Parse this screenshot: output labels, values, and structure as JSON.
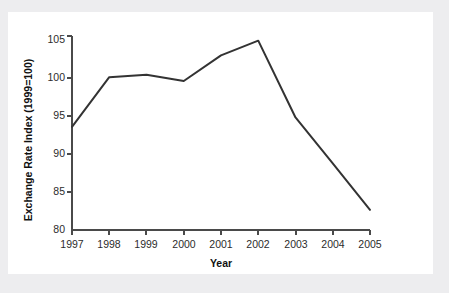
{
  "chart_data": {
    "type": "line",
    "title": "",
    "subtitle": "",
    "xlabel": "Year",
    "ylabel": "Exchange Rate Index (1999=100)",
    "categories": [
      "1997",
      "1998",
      "1999",
      "2000",
      "2001",
      "2002",
      "2003",
      "2004",
      "2005"
    ],
    "x": [
      1997,
      1998,
      1999,
      2000,
      2001,
      2002,
      2003,
      2004,
      2005
    ],
    "values": [
      93.3,
      99.7,
      100.0,
      99.2,
      102.5,
      104.4,
      94.5,
      88.6,
      82.6
    ],
    "series": [
      {
        "name": "Exchange Rate Index",
        "values": [
          93.3,
          99.7,
          100.0,
          99.2,
          102.5,
          104.4,
          94.5,
          88.6,
          82.6
        ],
        "color": "#333333"
      }
    ],
    "ylim": [
      80,
      105
    ],
    "xlim": [
      1997,
      2005
    ],
    "yticks": [
      80,
      85,
      90,
      95,
      100,
      105
    ],
    "ytick_labels": [
      "80",
      "85",
      "90",
      "95",
      "100",
      "105"
    ],
    "xticks": [
      1997,
      1998,
      1999,
      2000,
      2001,
      2002,
      2003,
      2004,
      2005
    ],
    "xtick_labels": [
      "1997",
      "1998",
      "1999",
      "2000",
      "2001",
      "2002",
      "2003",
      "2004",
      "2005"
    ],
    "grid": false,
    "legend": false,
    "legend_position": "none",
    "markers": false,
    "annotations": []
  },
  "style": {
    "page_background": "#ededef",
    "card_background": "#ffffff",
    "line_color": "#333333",
    "axis_color": "#4a4a4a",
    "text_color": "#2c2c2c"
  }
}
